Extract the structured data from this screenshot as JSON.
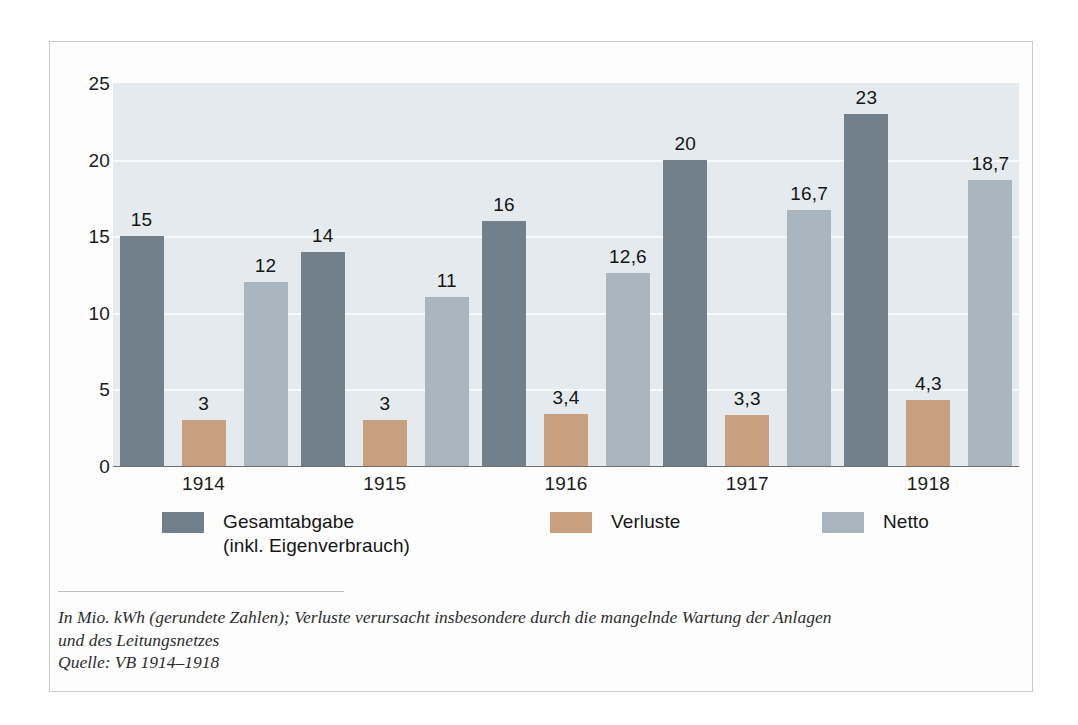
{
  "chart_data": {
    "type": "bar",
    "title": "",
    "subtitle": "",
    "xlabel": "",
    "ylabel": "",
    "categories": [
      "1914",
      "1915",
      "1916",
      "1917",
      "1918"
    ],
    "series": [
      {
        "name": "Gesamtabgabe\n(inkl. Eigenverbrauch)",
        "color": "#72808c",
        "values": [
          15,
          14,
          16,
          20,
          23
        ],
        "labels": [
          "15",
          "14",
          "16",
          "20",
          "23"
        ]
      },
      {
        "name": "Verluste",
        "color": "#c9a07f",
        "values": [
          3,
          3,
          3.4,
          3.3,
          4.3
        ],
        "labels": [
          "3",
          "3",
          "3,4",
          "3,3",
          "4,3"
        ]
      },
      {
        "name": "Netto",
        "color": "#aab6bf",
        "values": [
          12,
          11,
          12.6,
          16.7,
          18.7
        ],
        "labels": [
          "12",
          "11",
          "12,6",
          "16,7",
          "18,7"
        ]
      }
    ],
    "ylim": [
      0,
      25
    ],
    "yticks": [
      0,
      5,
      10,
      15,
      20,
      25
    ],
    "ytick_labels": [
      "0",
      "5",
      "10",
      "15",
      "20",
      "25"
    ],
    "grid": "horizontal",
    "gridline_color": "#f6fafb",
    "plot_background": "#e4eaed",
    "legend_position": "bottom"
  },
  "legend": {
    "items": [
      {
        "label": "Gesamtabgabe\n(inkl. Eigenverbrauch)",
        "color": "#72808c"
      },
      {
        "label": "Verluste",
        "color": "#c9a07f"
      },
      {
        "label": "Netto",
        "color": "#aab6bf"
      }
    ]
  },
  "footnote": {
    "line1": "In Mio. kWh (gerundete Zahlen); Verluste verursacht insbesondere durch die mangelnde Wartung der Anlagen",
    "line2": "und des Leitungsnetzes",
    "line3": "Quelle: VB 1914–1918"
  }
}
